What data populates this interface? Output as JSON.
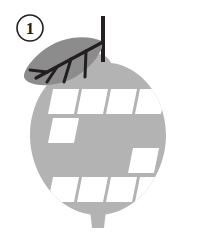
{
  "figure": {
    "step_number": "1",
    "background_color": "#ffffff"
  },
  "badge": {
    "label": "1",
    "shape": "circle",
    "stroke_color": "#231f20",
    "text_color": "#231f20",
    "fill_color": "#ffffff"
  },
  "fruit": {
    "name": "lemon-body",
    "fill_color": "#b3b3b3",
    "nub_top": "top-bump",
    "nub_bottom": "bottom-bump"
  },
  "leaf": {
    "name": "leaf",
    "fill_color": "#8c8c8c",
    "vein_color": "#231f20",
    "side_vein_count": 4
  },
  "stem": {
    "name": "stem",
    "color": "#231f20"
  },
  "slots": {
    "fill_color": "#ffffff",
    "shape": "parallelogram",
    "rows": [
      {
        "row_label": "row-1",
        "count": 4
      },
      {
        "row_label": "row-2",
        "count": 1
      },
      {
        "row_label": "row-3",
        "count": 1
      },
      {
        "row_label": "row-4",
        "count": 4
      }
    ],
    "total": 10
  }
}
